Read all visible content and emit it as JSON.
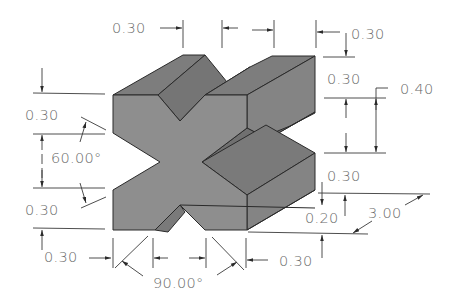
{
  "drawing": {
    "title": "V-block isometric drawing with dimensions",
    "colors": {
      "front_face": "#8e8e8e",
      "top_face": "#7b7b7b",
      "side_face": "#858585",
      "notch_face": "#6e6e6e",
      "edge": "#2a2a2a",
      "dimension_text": "#6a6a6a",
      "background": "#ffffff"
    },
    "dimensions": {
      "top_left_offset": "0.30",
      "top_right_offset": "0.30",
      "right_upper_height": "0.30",
      "right_slot_height": "0.40",
      "right_lower_height": "0.30",
      "base_step": "0.20",
      "depth": "3.00",
      "left_top": "0.30",
      "left_angle": "60.00°",
      "left_bottom": "0.30",
      "bottom_left": "0.30",
      "bottom_angle": "90.00°",
      "bottom_right": "0.30"
    }
  }
}
